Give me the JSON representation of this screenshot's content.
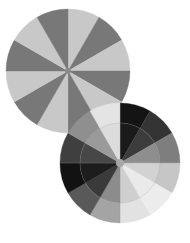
{
  "figure": {
    "canvas": {
      "width": 190,
      "height": 243,
      "background": "#ffffff"
    },
    "palette": {
      "light": "#c8c8c8",
      "medium": "#787878",
      "near_black": "#111111",
      "very_light": "#e8e8e8",
      "guide_line": "#9a9a9a",
      "hub": "#8a8a8a"
    }
  },
  "chart_data": {
    "type": "pie",
    "xlabel": "",
    "ylabel": "",
    "legend": "none",
    "grid": false,
    "charts": [
      {
        "name": "upper-left-disc",
        "center": {
          "x": 68,
          "y": 71
        },
        "radius": 62,
        "segment_count": 12,
        "segment_angle_deg": 30,
        "start_angle_deg": -90,
        "rings": 1,
        "categories": [
          "s1",
          "s2",
          "s3",
          "s4",
          "s5",
          "s6",
          "s7",
          "s8",
          "s9",
          "s10",
          "s11",
          "s12"
        ],
        "values": [
          30,
          30,
          30,
          30,
          30,
          30,
          30,
          30,
          30,
          30,
          30,
          30
        ],
        "colors": [
          "#c8c8c8",
          "#787878",
          "#c8c8c8",
          "#787878",
          "#c8c8c8",
          "#787878",
          "#c8c8c8",
          "#787878",
          "#c8c8c8",
          "#787878",
          "#c8c8c8",
          "#787878"
        ],
        "hub_radius": 3,
        "hub_color": "#8a8a8a",
        "guides": {
          "arc": false,
          "crosshair": false
        }
      },
      {
        "name": "lower-right-disc",
        "center": {
          "x": 120,
          "y": 163
        },
        "radius": 60,
        "inner_radius": 40,
        "segment_count": 12,
        "segment_angle_deg": 30,
        "start_angle_deg": -90,
        "rings": 2,
        "categories": [
          "s1",
          "s2",
          "s3",
          "s4",
          "s5",
          "s6",
          "s7",
          "s8",
          "s9",
          "s10",
          "s11",
          "s12"
        ],
        "values": [
          30,
          30,
          30,
          30,
          30,
          30,
          30,
          30,
          30,
          30,
          30,
          30
        ],
        "inner_colors": [
          "#1a1a1a",
          "#3c3c3c",
          "#8e8e8e",
          "#d2d2d2",
          "#eaeaea",
          "#cfcfcf",
          "#8c8c8c",
          "#3a3a3a",
          "#1d1d1d",
          "#474747",
          "#9a9a9a",
          "#dcdcdc"
        ],
        "outer_colors": [
          "#141414",
          "#343434",
          "#7e7e7e",
          "#c6c6c6",
          "#ececec",
          "#e2e2e2",
          "#a4a4a4",
          "#595959",
          "#121212",
          "#3f3f3f",
          "#8f8f8f",
          "#e4e4e4"
        ],
        "hub_radius": 4,
        "hub_color": "#a8a8a8",
        "guides": {
          "arc": true,
          "crosshair": true,
          "guide_color": "#9a9a9a"
        }
      }
    ]
  }
}
